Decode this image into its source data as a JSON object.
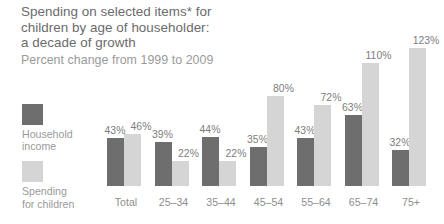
{
  "chart_data": {
    "type": "bar",
    "title": "Spending on selected items* for children by age of householder: a decade of growth",
    "title_lines": [
      "Spending on selected items* for",
      "children by age of householder:",
      "a decade of growth"
    ],
    "subtitle": "Percent change from 1999 to 2009",
    "xlabel": "",
    "ylabel": "",
    "ylim": [
      0,
      123
    ],
    "grid": false,
    "legend_position": "left",
    "categories": [
      "Total",
      "25–34",
      "35–44",
      "45–54",
      "55–64",
      "65–74",
      "75+"
    ],
    "series": [
      {
        "name": "Household income",
        "color": "#6e6e6e",
        "values": [
          43,
          39,
          44,
          35,
          43,
          63,
          32
        ],
        "labels": [
          "43%",
          "39%",
          "44%",
          "35%",
          "43%",
          "63%",
          "32%"
        ]
      },
      {
        "name": "Spending for children",
        "color": "#d5d5d5",
        "values": [
          46,
          22,
          22,
          80,
          72,
          110,
          123
        ],
        "labels": [
          "46%",
          "22%",
          "22%",
          "80%",
          "72%",
          "110%",
          "123%"
        ]
      }
    ]
  },
  "legend": {
    "items": [
      {
        "label": "Household\nincome",
        "color": "#6e6e6e"
      },
      {
        "label": "Spending\nfor children",
        "color": "#d5d5d5"
      }
    ]
  },
  "colors": {
    "background": "#ffffff",
    "title_text": "#6b6b6b",
    "subtitle_text": "#9a9a9a",
    "value_label_text": "#7d7d7d",
    "category_label_text": "#8e8e8e",
    "series_dark": "#6e6e6e",
    "series_light": "#d5d5d5"
  }
}
